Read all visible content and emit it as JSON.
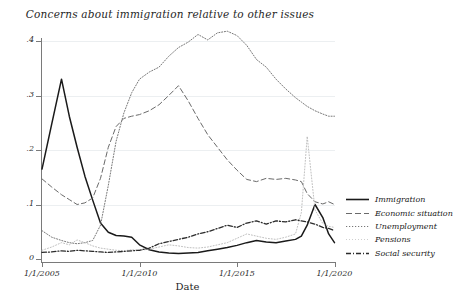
{
  "chart_data": {
    "type": "line",
    "title": "Concerns about immigration relative to other issues",
    "xlabel": "Date",
    "ylabel": "",
    "grid": true,
    "legend_position": "right",
    "xlim": [
      2005.0,
      2020.0
    ],
    "ylim": [
      0,
      0.4
    ],
    "xticks": [
      "1/1/2005",
      "1/1/2010",
      "1/1/2015",
      "1/1/2020"
    ],
    "xtick_values": [
      2005,
      2010,
      2015,
      2020
    ],
    "yticks": [
      "0",
      ".1",
      ".2",
      ".3",
      ".4"
    ],
    "ytick_values": [
      0,
      0.1,
      0.2,
      0.3,
      0.4
    ],
    "x": [
      2005.0,
      2005.5,
      2006.0,
      2006.4,
      2006.8,
      2007.2,
      2007.6,
      2008.0,
      2008.4,
      2008.8,
      2009.2,
      2009.6,
      2010.0,
      2010.5,
      2011.0,
      2011.5,
      2012.0,
      2012.5,
      2013.0,
      2013.5,
      2014.0,
      2014.5,
      2015.0,
      2015.5,
      2016.0,
      2016.5,
      2017.0,
      2017.5,
      2018.0,
      2018.3,
      2018.6,
      2019.0,
      2019.4,
      2019.7,
      2020.0
    ],
    "series": [
      {
        "name": "Immigration",
        "style": "solid",
        "color": "#1a1a1a",
        "values": [
          0.165,
          0.248,
          0.33,
          0.262,
          0.205,
          0.152,
          0.108,
          0.066,
          0.049,
          0.043,
          0.042,
          0.04,
          0.026,
          0.017,
          0.013,
          0.011,
          0.01,
          0.011,
          0.012,
          0.015,
          0.018,
          0.021,
          0.025,
          0.03,
          0.034,
          0.031,
          0.03,
          0.033,
          0.036,
          0.042,
          0.062,
          0.1,
          0.076,
          0.046,
          0.03
        ]
      },
      {
        "name": "Economic situation",
        "style": "dashed",
        "color": "#6a6a6a",
        "values": [
          0.147,
          0.132,
          0.118,
          0.109,
          0.1,
          0.103,
          0.112,
          0.148,
          0.205,
          0.243,
          0.258,
          0.262,
          0.265,
          0.272,
          0.283,
          0.3,
          0.318,
          0.29,
          0.258,
          0.228,
          0.205,
          0.182,
          0.163,
          0.146,
          0.142,
          0.148,
          0.146,
          0.148,
          0.145,
          0.142,
          0.12,
          0.105,
          0.101,
          0.105,
          0.1
        ]
      },
      {
        "name": "Unemployment",
        "style": "dotted",
        "color": "#787878",
        "values": [
          0.052,
          0.04,
          0.034,
          0.03,
          0.028,
          0.03,
          0.034,
          0.062,
          0.135,
          0.216,
          0.268,
          0.305,
          0.33,
          0.343,
          0.352,
          0.372,
          0.388,
          0.398,
          0.412,
          0.402,
          0.415,
          0.418,
          0.41,
          0.392,
          0.366,
          0.352,
          0.33,
          0.312,
          0.296,
          0.288,
          0.28,
          0.272,
          0.266,
          0.262,
          0.262
        ]
      },
      {
        "name": "Pensions",
        "style": "lightdot",
        "color": "#b8b8b8",
        "values": [
          0.016,
          0.022,
          0.03,
          0.026,
          0.035,
          0.03,
          0.024,
          0.02,
          0.018,
          0.016,
          0.015,
          0.017,
          0.016,
          0.018,
          0.022,
          0.026,
          0.024,
          0.021,
          0.02,
          0.022,
          0.026,
          0.03,
          0.038,
          0.046,
          0.042,
          0.038,
          0.036,
          0.04,
          0.046,
          0.085,
          0.225,
          0.09,
          0.065,
          0.06,
          0.058
        ]
      },
      {
        "name": "Social security",
        "style": "dashdot",
        "color": "#2b2b2b",
        "values": [
          0.012,
          0.013,
          0.015,
          0.014,
          0.016,
          0.015,
          0.014,
          0.013,
          0.012,
          0.013,
          0.014,
          0.015,
          0.016,
          0.02,
          0.028,
          0.032,
          0.036,
          0.04,
          0.046,
          0.05,
          0.056,
          0.062,
          0.058,
          0.066,
          0.07,
          0.064,
          0.07,
          0.068,
          0.072,
          0.07,
          0.068,
          0.064,
          0.058,
          0.056,
          0.052
        ]
      }
    ]
  },
  "legend": {
    "items": [
      {
        "label": "Immigration"
      },
      {
        "label": "Economic situation"
      },
      {
        "label": "Unemployment"
      },
      {
        "label": "Pensions"
      },
      {
        "label": "Social security"
      }
    ]
  }
}
